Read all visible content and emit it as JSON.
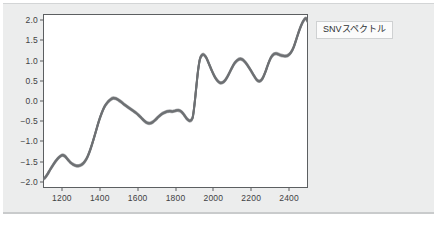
{
  "panel": {
    "name": "snv-spectrum-figure-panel",
    "background_color": "#eceded"
  },
  "legend": {
    "label": "SNVスペクトル",
    "position": "outside-right-top",
    "box_color": "#fbfbfb"
  },
  "chart_data": {
    "type": "line",
    "title": "",
    "xlabel": "",
    "ylabel": "",
    "xlim": [
      1100,
      2500
    ],
    "ylim": [
      -2.15,
      2.15
    ],
    "xticks": [
      1200,
      1400,
      1600,
      1800,
      2000,
      2200,
      2400
    ],
    "yticks": [
      2.0,
      1.5,
      1.0,
      0.5,
      0.0,
      -0.5,
      -1.0,
      -1.5,
      -2.0
    ],
    "ytick_labels": [
      "2.0",
      "1.5",
      "1.0",
      "0.5",
      "0.0",
      "-0.5",
      "-1.0",
      "-1.5",
      "-2.0"
    ],
    "xtick_labels": [
      "1200",
      "1400",
      "1600",
      "1800",
      "2000",
      "2200",
      "2400"
    ],
    "grid": false,
    "legend_position": "outside right top",
    "line_color": "#6d7073",
    "line_width": 2.6,
    "series": [
      {
        "name": "SNVスペクトル",
        "x": [
          1100,
          1110,
          1125,
          1140,
          1155,
          1170,
          1185,
          1200,
          1215,
          1230,
          1245,
          1260,
          1275,
          1290,
          1305,
          1320,
          1335,
          1350,
          1365,
          1380,
          1395,
          1410,
          1425,
          1440,
          1455,
          1470,
          1485,
          1500,
          1515,
          1530,
          1545,
          1560,
          1575,
          1590,
          1605,
          1620,
          1635,
          1650,
          1665,
          1680,
          1695,
          1710,
          1725,
          1740,
          1755,
          1770,
          1785,
          1800,
          1815,
          1830,
          1845,
          1860,
          1875,
          1890,
          1900,
          1910,
          1920,
          1930,
          1945,
          1960,
          1975,
          1990,
          2005,
          2020,
          2035,
          2050,
          2065,
          2080,
          2095,
          2110,
          2125,
          2140,
          2155,
          2170,
          2185,
          2200,
          2215,
          2230,
          2245,
          2260,
          2275,
          2290,
          2305,
          2320,
          2335,
          2350,
          2365,
          2380,
          2395,
          2410,
          2425,
          2440,
          2455,
          2470,
          2480,
          2490,
          2500
        ],
        "y": [
          -1.92,
          -1.9,
          -1.8,
          -1.68,
          -1.57,
          -1.47,
          -1.39,
          -1.34,
          -1.36,
          -1.44,
          -1.52,
          -1.57,
          -1.6,
          -1.6,
          -1.57,
          -1.5,
          -1.38,
          -1.2,
          -0.98,
          -0.74,
          -0.5,
          -0.3,
          -0.14,
          -0.04,
          0.03,
          0.07,
          0.06,
          0.02,
          -0.03,
          -0.09,
          -0.14,
          -0.19,
          -0.24,
          -0.29,
          -0.35,
          -0.42,
          -0.49,
          -0.54,
          -0.55,
          -0.52,
          -0.46,
          -0.39,
          -0.33,
          -0.29,
          -0.26,
          -0.25,
          -0.26,
          -0.24,
          -0.23,
          -0.26,
          -0.34,
          -0.44,
          -0.49,
          -0.42,
          -0.1,
          0.35,
          0.78,
          1.05,
          1.15,
          1.09,
          0.94,
          0.77,
          0.62,
          0.51,
          0.45,
          0.46,
          0.53,
          0.65,
          0.79,
          0.92,
          1.0,
          1.04,
          1.02,
          0.95,
          0.85,
          0.74,
          0.62,
          0.52,
          0.49,
          0.56,
          0.72,
          0.92,
          1.08,
          1.16,
          1.17,
          1.14,
          1.12,
          1.11,
          1.13,
          1.2,
          1.34,
          1.55,
          1.76,
          1.93,
          2.01,
          2.04,
          1.95
        ]
      }
    ]
  }
}
